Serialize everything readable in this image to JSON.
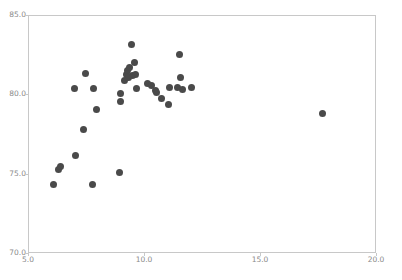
{
  "chart_data": {
    "type": "scatter",
    "title": "",
    "xlabel": "",
    "ylabel": "",
    "xlim": [
      5.0,
      20.0
    ],
    "ylim": [
      70.0,
      85.0
    ],
    "xticks": [
      5.0,
      10.0,
      15.0,
      20.0
    ],
    "yticks": [
      70.0,
      75.0,
      80.0,
      85.0
    ],
    "xtick_labels": [
      "5.0",
      "10.0",
      "15.0",
      "20.0"
    ],
    "ytick_labels": [
      "70.0",
      "75.0",
      "80.0",
      "85.0"
    ],
    "grid": false,
    "legend": null,
    "marker_color": "#4a4a4a",
    "marker_size": 7,
    "axes_color": "#c8c8c8",
    "tick_label_color": "#8a8a8a",
    "background_color": "#ffffff",
    "n_points": 38,
    "points": [
      {
        "x": 6.05,
        "y": 74.35
      },
      {
        "x": 6.25,
        "y": 75.35
      },
      {
        "x": 6.35,
        "y": 75.5
      },
      {
        "x": 6.95,
        "y": 80.45
      },
      {
        "x": 7.0,
        "y": 76.2
      },
      {
        "x": 7.35,
        "y": 77.85
      },
      {
        "x": 7.45,
        "y": 81.4
      },
      {
        "x": 7.75,
        "y": 74.35
      },
      {
        "x": 7.8,
        "y": 80.45
      },
      {
        "x": 7.9,
        "y": 79.1
      },
      {
        "x": 8.9,
        "y": 75.15
      },
      {
        "x": 8.95,
        "y": 79.6
      },
      {
        "x": 8.95,
        "y": 80.1
      },
      {
        "x": 9.1,
        "y": 80.95
      },
      {
        "x": 9.2,
        "y": 81.3
      },
      {
        "x": 9.25,
        "y": 81.55
      },
      {
        "x": 9.3,
        "y": 81.15
      },
      {
        "x": 9.35,
        "y": 81.75
      },
      {
        "x": 9.4,
        "y": 83.2
      },
      {
        "x": 9.45,
        "y": 81.25
      },
      {
        "x": 9.55,
        "y": 82.1
      },
      {
        "x": 9.6,
        "y": 81.3
      },
      {
        "x": 9.65,
        "y": 80.45
      },
      {
        "x": 10.1,
        "y": 80.75
      },
      {
        "x": 10.3,
        "y": 80.6
      },
      {
        "x": 10.45,
        "y": 80.3
      },
      {
        "x": 10.5,
        "y": 80.15
      },
      {
        "x": 10.7,
        "y": 79.8
      },
      {
        "x": 11.0,
        "y": 79.4
      },
      {
        "x": 11.05,
        "y": 80.5
      },
      {
        "x": 11.4,
        "y": 80.5
      },
      {
        "x": 11.5,
        "y": 82.55
      },
      {
        "x": 11.55,
        "y": 81.15
      },
      {
        "x": 11.6,
        "y": 80.35
      },
      {
        "x": 12.0,
        "y": 80.5
      },
      {
        "x": 17.65,
        "y": 78.85
      }
    ]
  }
}
